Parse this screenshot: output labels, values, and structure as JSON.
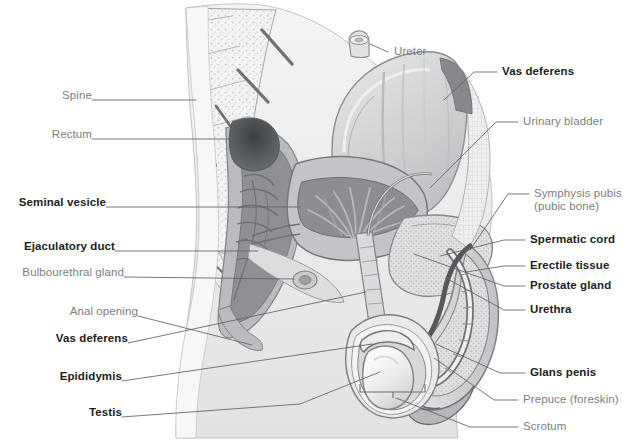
{
  "figure": {
    "type": "anatomical-illustration",
    "background_color": "#ffffff",
    "label_color_regular": "#7d7d80",
    "label_color_bold": "#1d1d1f",
    "tissue_colors": {
      "bone_light": "#f2f2f2",
      "muscle_mid": "#b9bbbd",
      "cavity_dark": "#8e9093",
      "lumen_darkest": "#5f6265",
      "outline": "#8a8c8f",
      "skin_pale": "#ededed",
      "erectile_stipple": "#cfd1d3"
    }
  },
  "labels_left": [
    {
      "id": "spine",
      "text": "Spine",
      "bold": false,
      "x": 57,
      "y": 95
    },
    {
      "id": "rectum",
      "text": "Rectum",
      "bold": false,
      "x": 44,
      "y": 134
    },
    {
      "id": "seminal-vesicle",
      "text": "Seminal vesicle",
      "bold": true,
      "x": 14,
      "y": 202
    },
    {
      "id": "ejaculatory-duct",
      "text": "Ejaculatory duct",
      "bold": true,
      "x": 17,
      "y": 246
    },
    {
      "id": "bulbourethral-gland",
      "text": "Bulbourethral gland",
      "bold": false,
      "x": 14,
      "y": 272
    },
    {
      "id": "anal-opening",
      "text": "Anal opening",
      "bold": false,
      "x": 70,
      "y": 311
    },
    {
      "id": "vas-deferens-left",
      "text": "Vas deferens",
      "bold": true,
      "x": 61,
      "y": 338
    },
    {
      "id": "epididymis",
      "text": "Epididymis",
      "bold": true,
      "x": 62,
      "y": 376
    },
    {
      "id": "testis",
      "text": "Testis",
      "bold": true,
      "x": 93,
      "y": 412
    }
  ],
  "labels_right": [
    {
      "id": "ureter",
      "text": "Ureter",
      "bold": false,
      "x": 394,
      "y": 48
    },
    {
      "id": "vas-deferens-right",
      "text": "Vas deferens",
      "bold": true,
      "x": 502,
      "y": 68
    },
    {
      "id": "urinary-bladder",
      "text": "Urinary bladder",
      "bold": false,
      "x": 523,
      "y": 118
    },
    {
      "id": "symphysis-pubis",
      "text": "Symphysis pubis",
      "bold": false,
      "x": 534,
      "y": 190
    },
    {
      "id": "pubic-bone",
      "text": "(pubic bone)",
      "bold": false,
      "x": 534,
      "y": 203
    },
    {
      "id": "spermatic-cord",
      "text": "Spermatic cord",
      "bold": true,
      "x": 530,
      "y": 236
    },
    {
      "id": "erectile-tissue",
      "text": "Erectile tissue",
      "bold": true,
      "x": 530,
      "y": 262
    },
    {
      "id": "prostate-gland",
      "text": "Prostate gland",
      "bold": true,
      "x": 530,
      "y": 282
    },
    {
      "id": "urethra",
      "text": "Urethra",
      "bold": true,
      "x": 530,
      "y": 306
    },
    {
      "id": "glans-penis",
      "text": "Glans penis",
      "bold": true,
      "x": 530,
      "y": 369
    },
    {
      "id": "prepuce",
      "text": "Prepuce (foreskin)",
      "bold": false,
      "x": 523,
      "y": 396
    },
    {
      "id": "scrotum",
      "text": "Scrotum",
      "bold": false,
      "x": 523,
      "y": 423
    }
  ]
}
